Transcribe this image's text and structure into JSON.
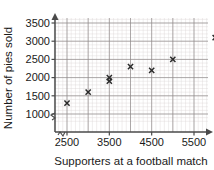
{
  "chart_data": {
    "type": "scatter",
    "title": "",
    "xlabel": "Supporters at a football match",
    "ylabel": "Number of pies sold",
    "xlim": [
      2000,
      6250
    ],
    "ylim": [
      750,
      3750
    ],
    "xticks": [
      2500,
      3500,
      4500,
      5500
    ],
    "yticks": [
      1000,
      1500,
      2000,
      2500,
      3000,
      3500
    ],
    "xtick_labels": [
      "2500",
      "3500",
      "4500",
      "5500"
    ],
    "ytick_labels": [
      "1000",
      "1500",
      "2000",
      "2500",
      "3000",
      "3500"
    ],
    "grid": true,
    "grid_minor": true,
    "axis_break_x": true,
    "axis_break_y": true,
    "legend": null,
    "marker": "x",
    "marker_color": "#2a2a2a",
    "x": [
      2500,
      3000,
      3500,
      3500,
      4000,
      4500,
      5000,
      6000
    ],
    "y": [
      1300,
      1600,
      1900,
      2000,
      2300,
      2200,
      2500,
      3100
    ],
    "points": [
      {
        "x": 2500,
        "y": 1300
      },
      {
        "x": 3000,
        "y": 1600
      },
      {
        "x": 3500,
        "y": 1900
      },
      {
        "x": 3500,
        "y": 2000
      },
      {
        "x": 4000,
        "y": 2300
      },
      {
        "x": 4500,
        "y": 2200
      },
      {
        "x": 5000,
        "y": 2500
      },
      {
        "x": 6000,
        "y": 3100
      }
    ]
  },
  "axes": {
    "x_title": "Supporters at a football match",
    "y_title": "Number of pies sold"
  },
  "colors": {
    "marker": "#2a2a2a",
    "major_grid": "#8f8a8a",
    "minor_grid": "#d9d4d4",
    "axis": "#4a4a4a",
    "text": "#1a1a1a",
    "background": "#ffffff"
  }
}
